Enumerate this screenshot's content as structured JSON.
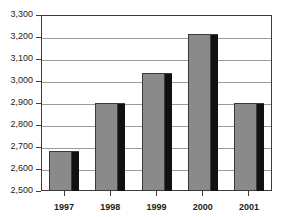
{
  "chart_data": {
    "type": "bar",
    "title": "",
    "xlabel": "",
    "ylabel": "",
    "categories": [
      "1997",
      "1998",
      "1999",
      "2000",
      "2001"
    ],
    "values": [
      2680,
      2900,
      3035,
      3215,
      2900
    ],
    "ylim": [
      2500,
      3300
    ],
    "ytick_step": 100,
    "ytick_labels": [
      "3,300",
      "3,200",
      "3,100",
      "3,000",
      "2,900",
      "2,800",
      "2,700",
      "2,600",
      "2,500"
    ],
    "ytick_values": [
      3300,
      3200,
      3100,
      3000,
      2900,
      2800,
      2700,
      2600,
      2500
    ],
    "grid": true,
    "legend": false,
    "series": [
      {
        "name": "",
        "values": [
          2680,
          2900,
          3035,
          3215,
          2900
        ]
      }
    ]
  },
  "style": {
    "bar_fill": "#8a8a8a",
    "bar_shadow": "#111111",
    "bar_outline": "#3a3a3a",
    "gridline": "#9a9a9a",
    "frame": "#3b3b3b",
    "plot_background": "#ffffff",
    "label_color": "#232323"
  },
  "title_remnant": {
    "text": ""
  }
}
